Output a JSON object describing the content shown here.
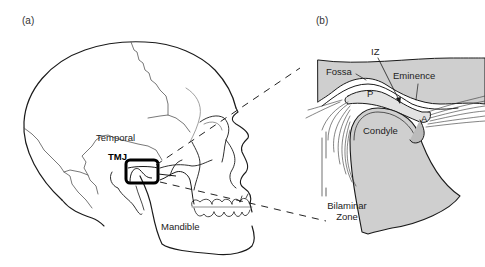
{
  "figure": {
    "panels": [
      {
        "id": "a",
        "label": "(a)",
        "title": "Lateral skull view",
        "labels": {
          "temporal": "Temporal",
          "tmj": "TMJ",
          "mandible": "Mandible"
        }
      },
      {
        "id": "b",
        "label": "(b)",
        "title": "Magnified TMJ cross-section",
        "labels": {
          "iz": "IZ",
          "fossa": "Fossa",
          "eminence": "Eminence",
          "p": "P",
          "a": "A",
          "condyle": "Condyle",
          "bilaminar_line1": "Bilaminar",
          "bilaminar_line2": "Zone"
        }
      }
    ],
    "colors": {
      "line": "#1a1a1a",
      "suture": "#555555",
      "bone_fill": "#cfcfcf",
      "disc_fill": "#e2e2e2",
      "highlight_box": "#000000"
    }
  }
}
